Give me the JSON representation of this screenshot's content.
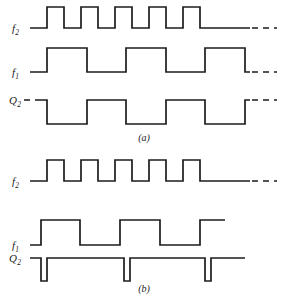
{
  "figure": {
    "type": "digital-timing-diagram",
    "stroke_color": "#1d1d1d",
    "background_color": "#ffffff"
  },
  "panels": [
    {
      "id": "a",
      "caption": "(a)",
      "signals": [
        {
          "name": "f2",
          "label_base": "f",
          "label_sub": "2",
          "idle_level": "low",
          "period_px": 34,
          "pulses": 5,
          "trailing": "dashed-low",
          "note": "square wave, 5 high pulses, ends low with dashed continuation"
        },
        {
          "name": "f1",
          "label_base": "f",
          "label_sub": "1",
          "idle_level": "low",
          "period_px": 68,
          "pulses": 3,
          "trailing": "dashed-low",
          "note": "half-rate square wave relative to f2, 3 high pulses"
        },
        {
          "name": "Q2",
          "label_base": "Q",
          "label_sub": "2",
          "idle_level": "high",
          "period_px": 68,
          "pulses": 3,
          "leading": "dashed-high",
          "trailing": "dashed-high",
          "note": "starts high with dashed lead-in, 3 low intervals, ends high dashed"
        }
      ]
    },
    {
      "id": "b",
      "caption": "(b)",
      "signals": [
        {
          "name": "f2",
          "label_base": "f",
          "label_sub": "2",
          "idle_level": "low",
          "period_px": 34,
          "pulses": 5,
          "trailing": "dashed-low",
          "note": "same square wave as in panel (a)"
        },
        {
          "name": "f1",
          "label_base": "f",
          "label_sub": "1",
          "idle_level": "low",
          "period_px": 68,
          "pulses": 3,
          "trailing": "solid-high",
          "note": "half-rate square wave, ends high, no dashed continuation"
        },
        {
          "name": "Q2",
          "label_base": "Q",
          "label_sub": "2",
          "idle_level": "high",
          "pulses": 3,
          "pulse_shape": "narrow-low-spike",
          "trailing": "solid-high",
          "note": "mostly high with three narrow downward spikes"
        }
      ]
    }
  ],
  "geometry": {
    "panel_a": {
      "f2": {
        "solid_path": "M 30 28 L 47 28 L 47 7 L 64 7 L 64 28 L 81 28 L 81 7 L 98 7 L 98 28 L 115 28 L 115 7 L 132 7 L 132 28 L 149 28 L 149 7 L 166 7 L 166 28 L 183 28 L 183 7 L 200 7 L 200 28 L 250 28",
        "dash_path": "M 252 28 L 277 28"
      },
      "f1": {
        "solid_path": "M 30 72 L 47 72 L 47 48 L 87 48 L 87 72 L 126 72 L 126 48 L 166 48 L 166 72 L 205 72 L 205 48 L 245 48 L 245 72 L 250 72",
        "dash_path": "M 252 72 L 277 72"
      },
      "Q2": {
        "solid_path": "M 38 100 L 47 100 L 47 124 L 87 124 L 87 100 L 126 100 L 126 124 L 166 124 L 166 100 L 205 100 L 205 124 L 245 124 L 245 100 L 250 100",
        "dash_lead_path": "M 24 100 L 38 100",
        "dash_path": "M 252 100 L 277 100"
      }
    },
    "panel_b": {
      "f2": {
        "solid_path": "M 30 28 L 47 28 L 47 7 L 64 7 L 64 28 L 81 28 L 81 7 L 98 7 L 98 28 L 115 28 L 115 7 L 132 7 L 132 28 L 149 28 L 149 7 L 166 7 L 166 28 L 183 28 L 183 7 L 200 7 L 200 28 L 250 28",
        "dash_path": "M 252 28 L 277 28"
      },
      "f1": {
        "solid_path": "M 30 92 L 41 92 L 41 67 L 80 67 L 80 92 L 120 92 L 120 67 L 160 67 L 160 92 L 200 92 L 200 67 L 225 67"
      },
      "Q2": {
        "solid_path": "M 30 105 L 41 105 L 41 128 L 47 128 L 47 105 L 124 105 L 124 128 L 130 128 L 130 105 L 205 105 L 205 128 L 211 128 L 211 105 L 245 105"
      }
    },
    "labels": {
      "panel_a": {
        "f2": {
          "x": 12,
          "y": 23
        },
        "f1": {
          "x": 12,
          "y": 67
        },
        "Q2": {
          "x": 9,
          "y": 95
        }
      },
      "panel_b": {
        "f2": {
          "x": 12,
          "y": 23
        },
        "f1": {
          "x": 12,
          "y": 87
        },
        "Q2": {
          "x": 9,
          "y": 100
        }
      },
      "caption_a_y": 132,
      "caption_b_y": 130
    }
  }
}
